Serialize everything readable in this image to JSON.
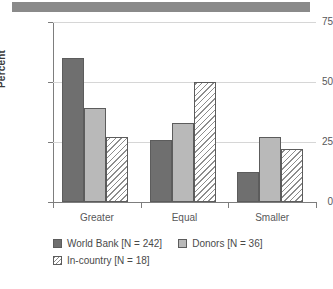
{
  "header_band": {
    "color": "#8a8a8a"
  },
  "chart_data": {
    "type": "bar",
    "title": "",
    "xlabel": "",
    "ylabel": "Percent",
    "ylim": [
      0,
      75
    ],
    "yticks": [
      0,
      25,
      50,
      75
    ],
    "ytick_labels": [
      "0",
      "25",
      "50",
      "75"
    ],
    "grid": true,
    "legend_position": "bottom",
    "categories": [
      "Greater",
      "Equal",
      "Smaller"
    ],
    "series": [
      {
        "name": "World Bank [N = 242]",
        "color": "#6f6f6f",
        "fill": "solid",
        "values": [
          60,
          26,
          12.5
        ]
      },
      {
        "name": "Donors [N = 36]",
        "color": "#b9b9b9",
        "fill": "solid",
        "values": [
          39,
          33,
          27
        ]
      },
      {
        "name": "In-country [N = 18]",
        "color": "#ffffff",
        "fill": "diagonal-hatch",
        "values": [
          27,
          50,
          22
        ]
      }
    ]
  }
}
